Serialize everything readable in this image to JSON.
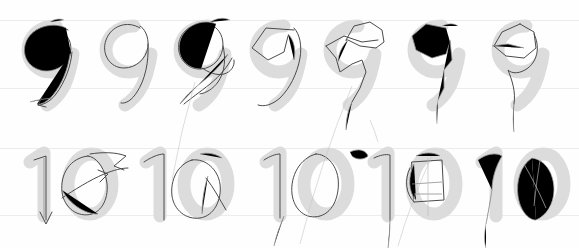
{
  "sheet": {
    "title": "Handwriting tracing practice sheet",
    "background_color": "#fefefe",
    "rule_color": "#ececec",
    "ghost_color": "#dcdcdc",
    "ink_color": "#4a4a4a",
    "width": 579,
    "height": 248
  },
  "rules": [
    {
      "name": "row1-top-rule",
      "y": 20
    },
    {
      "name": "row1-bottom-rule",
      "y": 88
    },
    {
      "name": "row2-top-rule",
      "y": 148
    },
    {
      "name": "row2-bottom-rule",
      "y": 215
    }
  ],
  "rows": [
    {
      "name": "row-nine",
      "label": "9",
      "top": 8,
      "count": 7,
      "cells": [
        {
          "label": "9",
          "x": 12,
          "width": 78,
          "variant": "scribbled-loop",
          "travel": false
        },
        {
          "label": "9",
          "x": 90,
          "width": 74,
          "variant": "clean-single",
          "travel": false
        },
        {
          "label": "9",
          "x": 164,
          "width": 76,
          "variant": "double-loop",
          "travel": true
        },
        {
          "label": "9",
          "x": 240,
          "width": 74,
          "variant": "angular-open",
          "travel": false
        },
        {
          "label": "9",
          "x": 314,
          "width": 84,
          "variant": "polygonal",
          "travel": true
        },
        {
          "label": "9",
          "x": 398,
          "width": 84,
          "variant": "faint-angular",
          "travel": false
        },
        {
          "label": "9",
          "x": 482,
          "width": 90,
          "variant": "pointed-loop",
          "travel": false
        }
      ]
    },
    {
      "name": "row-ten",
      "label": "10",
      "top": 138,
      "count": 5,
      "cells": [
        {
          "label": "10",
          "x": 14,
          "width": 112,
          "variant": "arrowed-loop",
          "travel": false
        },
        {
          "label": "10",
          "x": 130,
          "width": 110,
          "variant": "open-oval",
          "travel": true
        },
        {
          "label": "10",
          "x": 250,
          "width": 108,
          "variant": "tall-oval",
          "travel": false
        },
        {
          "label": "10",
          "x": 358,
          "width": 110,
          "variant": "boxed-scratch",
          "travel": true
        },
        {
          "label": "10",
          "x": 466,
          "width": 106,
          "variant": "faint-outline",
          "travel": false
        }
      ]
    }
  ],
  "travel_lines": [
    {
      "name": "travel-line-a",
      "x1": 195,
      "y1": 82,
      "x2": 172,
      "y2": 180
    },
    {
      "name": "travel-line-b",
      "x1": 352,
      "y1": 86,
      "x2": 300,
      "y2": 244
    },
    {
      "name": "travel-line-c",
      "x1": 370,
      "y1": 120,
      "x2": 378,
      "y2": 142
    },
    {
      "name": "travel-line-d",
      "x1": 432,
      "y1": 156,
      "x2": 398,
      "y2": 246
    },
    {
      "name": "travel-line-e",
      "x1": 540,
      "y1": 160,
      "x2": 534,
      "y2": 206
    }
  ],
  "annotations": {
    "ghost_description": "light grey printed template digit",
    "ink_description": "dark traced pen stroke",
    "arrow_description": "directional arrowhead on stroke end"
  }
}
